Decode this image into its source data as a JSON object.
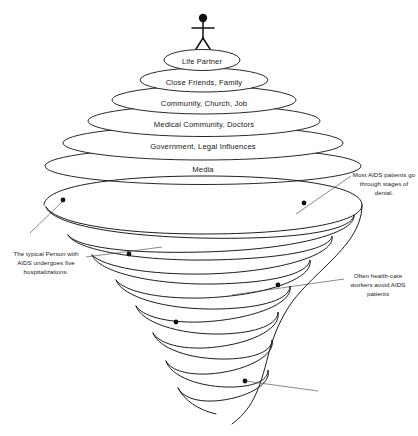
{
  "diagram": {
    "type": "spiral-funnel-diagram",
    "background_color": "#ffffff",
    "line_color": "#111111",
    "text_color": "#161616"
  },
  "figure": {
    "name": "person"
  },
  "rings": [
    {
      "index": 0,
      "label": "Life Partner",
      "cx": 202,
      "cy": 60,
      "rx": 38,
      "ry": 10.5
    },
    {
      "index": 1,
      "label": "Close Friends, Family",
      "cx": 204,
      "cy": 80,
      "rx": 64,
      "ry": 12
    },
    {
      "index": 2,
      "label": "Community, Church, Job",
      "cx": 204,
      "cy": 100,
      "rx": 92,
      "ry": 14
    },
    {
      "index": 3,
      "label": "Medical Community, Doctors",
      "cx": 204,
      "cy": 121,
      "rx": 116,
      "ry": 15.5
    },
    {
      "index": 4,
      "label": "Government, Legal Influences",
      "cx": 203,
      "cy": 143,
      "rx": 140,
      "ry": 17
    },
    {
      "index": 5,
      "label": "Media",
      "cx": 203,
      "cy": 166,
      "rx": 158,
      "ry": 18.5
    }
  ],
  "annotations": [
    {
      "id": "denial",
      "text": "Most AIDS patients go through stages of denial.",
      "position": "right",
      "marker_x": 304,
      "marker_y": 203
    },
    {
      "id": "hospitalizations",
      "text": "The typical Person with AIDS undergoes five hospitalizations.",
      "position": "left",
      "marker_x": 129,
      "marker_y": 254
    },
    {
      "id": "workers",
      "text": "Often health-care workers avoid AIDS patients",
      "position": "right",
      "marker_x": 278,
      "marker_y": 285
    }
  ],
  "markers": [
    {
      "id": "marker-1",
      "x": 63,
      "y": 200
    },
    {
      "id": "marker-2",
      "x": 304,
      "y": 203
    },
    {
      "id": "marker-3",
      "x": 129,
      "y": 254
    },
    {
      "id": "marker-4",
      "x": 278,
      "y": 285
    },
    {
      "id": "marker-5",
      "x": 176,
      "y": 322
    },
    {
      "id": "marker-6",
      "x": 245,
      "y": 381
    }
  ]
}
